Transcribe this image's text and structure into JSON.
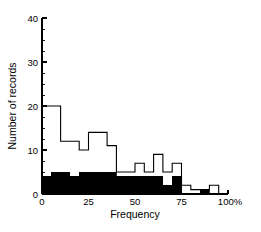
{
  "chart_data": {
    "type": "bar",
    "title": "",
    "subtitle": "",
    "xlabel": "Frequency",
    "ylabel": "Number of records",
    "xlim": [
      0,
      100
    ],
    "ylim": [
      0,
      40
    ],
    "grid": false,
    "legend": null,
    "bin_width": 5,
    "x_tick_labels": [
      "0",
      "25",
      "50",
      "75",
      "100%"
    ],
    "x_tick_values": [
      0,
      25,
      50,
      75,
      100
    ],
    "y_tick_labels": [
      "0",
      "10",
      "20",
      "30",
      "40"
    ],
    "y_tick_values": [
      0,
      10,
      20,
      30,
      40
    ],
    "y_minor_tick_step": 2.5,
    "bin_starts": [
      0,
      5,
      10,
      15,
      20,
      25,
      30,
      35,
      40,
      45,
      50,
      55,
      60,
      65,
      70,
      75,
      80,
      85,
      90,
      95
    ],
    "categories": [
      "0-5",
      "5-10",
      "10-15",
      "15-20",
      "20-25",
      "25-30",
      "30-35",
      "35-40",
      "40-45",
      "45-50",
      "50-55",
      "55-60",
      "60-65",
      "65-70",
      "70-75",
      "75-80",
      "80-85",
      "85-90",
      "90-95",
      "95-100"
    ],
    "series": [
      {
        "name": "Total records (outline)",
        "fill": "#ffffff",
        "stroke": "#000000",
        "values": [
          20,
          20,
          12,
          12,
          10,
          14,
          14,
          11,
          5,
          5,
          7,
          5,
          9,
          5,
          7,
          2,
          1,
          1,
          2,
          0
        ]
      },
      {
        "name": "Subset (filled)",
        "fill": "#000000",
        "stroke": "#000000",
        "values": [
          4,
          5,
          5,
          4,
          5,
          5,
          5,
          5,
          4,
          4,
          4,
          4,
          4,
          2,
          4,
          0,
          0,
          1,
          0,
          0
        ]
      }
    ]
  },
  "colors": {
    "background": "#ffffff",
    "ink": "#000000",
    "outline_fill": "#ffffff",
    "filled_bar": "#000000"
  }
}
